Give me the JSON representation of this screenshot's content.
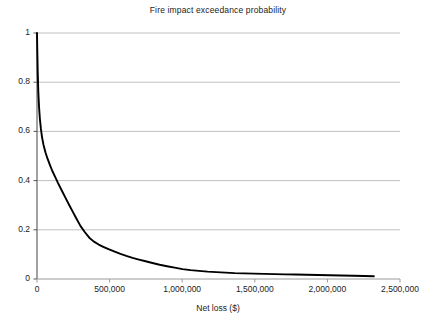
{
  "chart_data": {
    "type": "line",
    "title": "Fire impact exceedance probability",
    "xlabel": "Net loss ($)",
    "ylabel": "",
    "xlim": [
      0,
      2500000
    ],
    "ylim": [
      0,
      1
    ],
    "grid": true,
    "legend": false,
    "accent_color": "#000000",
    "grid_color": "#c0c0c0",
    "axis_color": "#555555",
    "x_ticks": [
      {
        "value": 0,
        "label": "0"
      },
      {
        "value": 500000,
        "label": "500,000"
      },
      {
        "value": 1000000,
        "label": "1,000,000"
      },
      {
        "value": 1500000,
        "label": "1,500,000"
      },
      {
        "value": 2000000,
        "label": "2,000,000"
      },
      {
        "value": 2500000,
        "label": "2,500,000"
      }
    ],
    "y_ticks": [
      {
        "value": 0,
        "label": "0"
      },
      {
        "value": 0.2,
        "label": "0.2"
      },
      {
        "value": 0.4,
        "label": "0.4"
      },
      {
        "value": 0.6,
        "label": "0.6"
      },
      {
        "value": 0.8,
        "label": "0.8"
      },
      {
        "value": 1,
        "label": "1"
      }
    ],
    "series": [
      {
        "name": "Exceedance probability",
        "x": [
          0,
          2000,
          5000,
          9000,
          14000,
          20000,
          27000,
          35000,
          45000,
          58000,
          72000,
          88000,
          105000,
          125000,
          145000,
          168000,
          192000,
          218000,
          245000,
          272000,
          300000,
          330000,
          360000,
          392000,
          425000,
          460000,
          497000,
          535000,
          575000,
          615000,
          658000,
          702000,
          748000,
          795000,
          845000,
          895000,
          948000,
          1002000,
          1058000,
          1115000,
          1175000,
          1235000,
          1298000,
          1362000,
          1428000,
          1495000,
          1565000,
          1635000,
          1708000,
          1782000,
          1858000,
          1935000,
          2015000,
          2095000,
          2178000,
          2255000,
          2320000
        ],
        "y": [
          1,
          0.93,
          0.84,
          0.76,
          0.7,
          0.65,
          0.61,
          0.575,
          0.545,
          0.515,
          0.49,
          0.465,
          0.44,
          0.415,
          0.39,
          0.363,
          0.335,
          0.305,
          0.275,
          0.245,
          0.215,
          0.19,
          0.168,
          0.152,
          0.14,
          0.13,
          0.12,
          0.111,
          0.102,
          0.094,
          0.086,
          0.079,
          0.072,
          0.065,
          0.058,
          0.052,
          0.046,
          0.04,
          0.036,
          0.033,
          0.03,
          0.028,
          0.026,
          0.024,
          0.023,
          0.022,
          0.021,
          0.02,
          0.019,
          0.018,
          0.017,
          0.016,
          0.015,
          0.014,
          0.013,
          0.012,
          0.011
        ]
      }
    ]
  }
}
